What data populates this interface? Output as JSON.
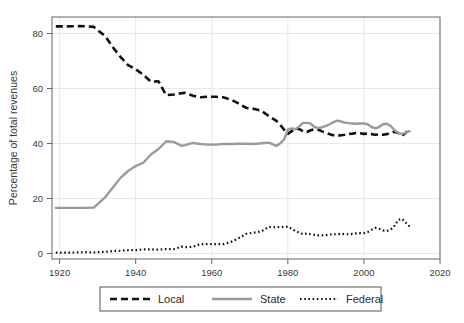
{
  "chart_data": {
    "type": "line",
    "title": "",
    "xlabel": "",
    "ylabel": "Percentage of total revenues",
    "xlim": [
      1918,
      2020
    ],
    "ylim": [
      -2,
      86
    ],
    "xticks": [
      1920,
      1940,
      1960,
      1980,
      2000,
      2020
    ],
    "yticks": [
      0,
      20,
      40,
      60,
      80
    ],
    "grid": true,
    "legend_position": "bottom",
    "colors": {
      "local": "#111111",
      "state": "#9a9a9a",
      "federal": "#111111",
      "grid": "#e8e8e8",
      "frame": "#666666"
    },
    "series": [
      {
        "name": "Local",
        "style": "dashed",
        "x": [
          1919,
          1922,
          1925,
          1927,
          1929,
          1932,
          1934,
          1936,
          1938,
          1940,
          1942,
          1944,
          1946,
          1948,
          1950,
          1952,
          1953,
          1955,
          1957,
          1959,
          1961,
          1963,
          1965,
          1967,
          1969,
          1971,
          1973,
          1975,
          1977,
          1978,
          1979,
          1980,
          1981,
          1982,
          1983,
          1984,
          1985,
          1986,
          1987,
          1988,
          1989,
          1990,
          1991,
          1992,
          1993,
          1994,
          1995,
          1996,
          1997,
          1998,
          1999,
          2000,
          2001,
          2002,
          2003,
          2004,
          2005,
          2006,
          2007,
          2008,
          2009,
          2010,
          2011,
          2012
        ],
        "values": [
          82.6,
          82.6,
          82.7,
          82.6,
          82.4,
          79.0,
          75.0,
          71.5,
          68.5,
          67.0,
          65.0,
          62.5,
          62.6,
          57.6,
          57.8,
          58.3,
          58.4,
          57.4,
          56.8,
          57.0,
          57.0,
          56.8,
          56.0,
          54.6,
          53.0,
          52.6,
          51.9,
          50.0,
          48.2,
          46.8,
          45.0,
          43.5,
          44.5,
          45.5,
          45.2,
          44.5,
          44.2,
          44.8,
          45.2,
          45.0,
          44.4,
          43.9,
          43.4,
          43.0,
          42.8,
          43.0,
          43.2,
          43.5,
          43.6,
          43.8,
          43.7,
          43.5,
          43.6,
          43.4,
          43.2,
          43.3,
          43.2,
          43.4,
          43.8,
          44.3,
          43.8,
          42.8,
          43.8,
          45.5
        ]
      },
      {
        "name": "State",
        "style": "solid",
        "x": [
          1919,
          1922,
          1925,
          1927,
          1929,
          1932,
          1934,
          1936,
          1938,
          1940,
          1942,
          1944,
          1946,
          1948,
          1950,
          1952,
          1953,
          1955,
          1957,
          1959,
          1961,
          1963,
          1965,
          1967,
          1969,
          1971,
          1973,
          1975,
          1977,
          1978,
          1979,
          1980,
          1981,
          1982,
          1983,
          1984,
          1985,
          1986,
          1987,
          1988,
          1989,
          1990,
          1991,
          1992,
          1993,
          1994,
          1995,
          1996,
          1997,
          1998,
          1999,
          2000,
          2001,
          2002,
          2003,
          2004,
          2005,
          2006,
          2007,
          2008,
          2009,
          2010,
          2011,
          2012
        ],
        "values": [
          16.6,
          16.6,
          16.6,
          16.6,
          16.7,
          20.5,
          24.0,
          27.5,
          30.0,
          31.8,
          33.0,
          36.0,
          38.0,
          40.8,
          40.6,
          39.2,
          39.4,
          40.2,
          39.8,
          39.6,
          39.6,
          39.8,
          39.8,
          39.9,
          39.9,
          39.8,
          40.1,
          40.3,
          39.1,
          40.1,
          41.4,
          45.0,
          45.5,
          45.2,
          46.2,
          47.5,
          47.5,
          47.2,
          46.0,
          45.6,
          45.9,
          46.4,
          47.0,
          47.8,
          48.3,
          48.0,
          47.6,
          47.4,
          47.3,
          47.2,
          47.3,
          47.3,
          47.0,
          46.0,
          45.5,
          46.0,
          47.0,
          47.2,
          46.4,
          44.9,
          43.8,
          43.5,
          43.9,
          44.5
        ]
      },
      {
        "name": "Federal",
        "style": "dotted",
        "x": [
          1919,
          1922,
          1925,
          1927,
          1929,
          1932,
          1934,
          1936,
          1938,
          1940,
          1942,
          1944,
          1946,
          1948,
          1950,
          1952,
          1953,
          1955,
          1957,
          1959,
          1961,
          1963,
          1965,
          1967,
          1969,
          1971,
          1973,
          1975,
          1977,
          1978,
          1979,
          1980,
          1981,
          1982,
          1983,
          1984,
          1985,
          1986,
          1987,
          1988,
          1989,
          1990,
          1991,
          1992,
          1993,
          1994,
          1995,
          1996,
          1997,
          1998,
          1999,
          2000,
          2001,
          2002,
          2003,
          2004,
          2005,
          2006,
          2007,
          2008,
          2009,
          2010,
          2011,
          2012
        ],
        "values": [
          0.3,
          0.3,
          0.4,
          0.5,
          0.4,
          0.6,
          0.9,
          1.0,
          1.2,
          1.2,
          1.5,
          1.5,
          1.4,
          1.6,
          1.6,
          2.5,
          2.3,
          2.4,
          3.4,
          3.4,
          3.4,
          3.4,
          4.2,
          5.5,
          7.1,
          7.6,
          8.0,
          9.7,
          9.5,
          9.7,
          9.6,
          9.8,
          9.0,
          8.2,
          7.5,
          7.0,
          7.3,
          7.0,
          6.8,
          6.6,
          6.6,
          6.7,
          6.9,
          7.0,
          7.0,
          7.2,
          7.0,
          7.0,
          7.1,
          7.3,
          7.4,
          7.4,
          7.8,
          8.6,
          9.3,
          9.0,
          8.4,
          8.2,
          8.6,
          10.0,
          12.2,
          12.6,
          11.2,
          9.8
        ]
      }
    ]
  },
  "axis": {
    "y_title": "Percentage of total revenues",
    "x_tick_labels": [
      "1920",
      "1940",
      "1960",
      "1980",
      "2000",
      "2020"
    ],
    "y_tick_labels": [
      "0",
      "20",
      "40",
      "60",
      "80"
    ]
  },
  "legend": {
    "items": [
      {
        "label": "Local",
        "style": "dashed"
      },
      {
        "label": "State",
        "style": "solid"
      },
      {
        "label": "Federal",
        "style": "dotted"
      }
    ]
  }
}
